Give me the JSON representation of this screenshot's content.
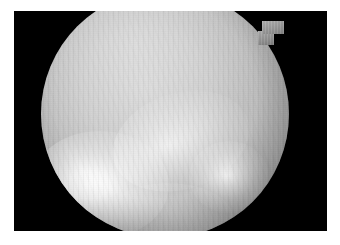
{
  "figure": {
    "kind": "grayscale-medical-scan",
    "modality_label": "fundus-like circular field image",
    "page_background": "#ffffff",
    "frame": {
      "background": "#000000",
      "x": 14,
      "y": 11,
      "width": 313,
      "height": 220
    },
    "disc": {
      "shape": "circle",
      "center_x": 165,
      "center_y": 114,
      "diameter": 248,
      "clipped_top": true,
      "clipped_bottom": true,
      "base_color": "#c6c6c6",
      "rim_color": "#6a6a6a",
      "texture": "vertical-scanlines"
    },
    "notch": {
      "label": "upper-right rectangular tab",
      "x": 262,
      "y": 21,
      "width": 22,
      "height": 13,
      "color": "#9b9b9b"
    },
    "hotspots": [
      {
        "name": "primary-bright-lesion",
        "center_x": 100,
        "center_y": 185,
        "radius_x": 69,
        "radius_y": 54,
        "peak_color": "#ffffff",
        "intensity": 0.98
      },
      {
        "name": "bright-streak-tail",
        "center_x": 181,
        "center_y": 141,
        "radius_x": 70,
        "radius_y": 48,
        "rotation_deg": -18,
        "peak_color": "#f2f2f2",
        "intensity": 0.7
      },
      {
        "name": "secondary-bright-spot",
        "center_x": 229,
        "center_y": 177,
        "radius_x": 40,
        "radius_y": 36,
        "peak_color": "#ededed",
        "intensity": 0.8
      },
      {
        "name": "lower-diffuse-glow",
        "center_x": 168,
        "center_y": 218,
        "radius_x": 65,
        "radius_y": 35,
        "peak_color": "#dcdcdc",
        "intensity": 0.22
      }
    ],
    "palette": {
      "white": "#ffffff",
      "black": "#000000",
      "disc_light": "#d6d6d6",
      "disc_mid": "#bcbcbc",
      "disc_dark": "#6a6a6a",
      "highlight": "#ffffff"
    }
  }
}
